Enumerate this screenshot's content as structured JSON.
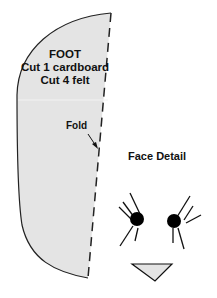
{
  "pattern": {
    "piece_name": "FOOT",
    "instruction_1": "Cut 1 cardboard",
    "instruction_2": "Cut 4 felt",
    "fold_label": "Fold",
    "fill_color": "#e4e4e4",
    "outline_color": "#222222"
  },
  "face": {
    "title": "Face Detail",
    "elements": [
      "left-eye",
      "right-eye",
      "left-lashes",
      "right-lashes",
      "nose-triangle"
    ],
    "eye_color": "#000000",
    "nose_fill": "#e4e4e4"
  }
}
